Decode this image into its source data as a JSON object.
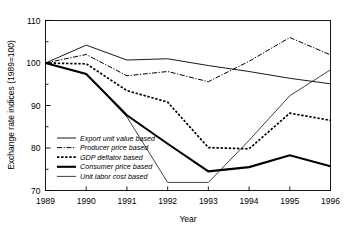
{
  "chart_data": {
    "type": "line",
    "title": "",
    "xlabel": "Year",
    "ylabel": "Exchange rate indices (1989=100)",
    "x": [
      1989,
      1990,
      1991,
      1992,
      1993,
      1994,
      1995,
      1996
    ],
    "xtick_labels": [
      "1989",
      "1990",
      "1991",
      "1992",
      "1993",
      "1994",
      "1995",
      "1996"
    ],
    "ytick_labels": [
      "70",
      "80",
      "90",
      "100",
      "110"
    ],
    "ytick_values": [
      70,
      80,
      90,
      100,
      110
    ],
    "yminor_values": [
      75,
      85,
      95,
      105
    ],
    "xlim": [
      1989,
      1996
    ],
    "ylim": [
      70,
      110
    ],
    "grid": false,
    "legend_position": "lower-left-inside",
    "series": [
      {
        "name": "Export unit value based",
        "style": "thin-solid",
        "values": [
          100.0,
          104.2,
          100.7,
          101.0,
          99.4,
          98.0,
          96.4,
          95.1
        ]
      },
      {
        "name": "Producer price based",
        "style": "dash-dot",
        "values": [
          100.0,
          102.0,
          97.0,
          98.0,
          95.6,
          100.4,
          106.0,
          101.9
        ]
      },
      {
        "name": "GDP deflator based",
        "style": "dotted",
        "values": [
          100.0,
          99.8,
          93.5,
          90.8,
          80.1,
          79.8,
          88.2,
          86.5
        ]
      },
      {
        "name": "Consumer price based",
        "style": "thick-solid",
        "values": [
          100.0,
          97.4,
          87.7,
          81.0,
          74.5,
          75.5,
          78.3,
          75.7
        ]
      },
      {
        "name": "Unit labor cost based",
        "style": "fine-dotted",
        "values": [
          100.0,
          97.4,
          87.3,
          71.9,
          71.9,
          81.8,
          92.3,
          98.4
        ]
      }
    ]
  },
  "legend": {
    "items": [
      {
        "label": "Export unit value based"
      },
      {
        "label": "Producer price based"
      },
      {
        "label": "GDP deflator based"
      },
      {
        "label": "Consumer price based"
      },
      {
        "label": "Unit labor cost based"
      }
    ]
  },
  "colors": {
    "axis": "#000000",
    "series": "#000000",
    "background": "#ffffff"
  }
}
